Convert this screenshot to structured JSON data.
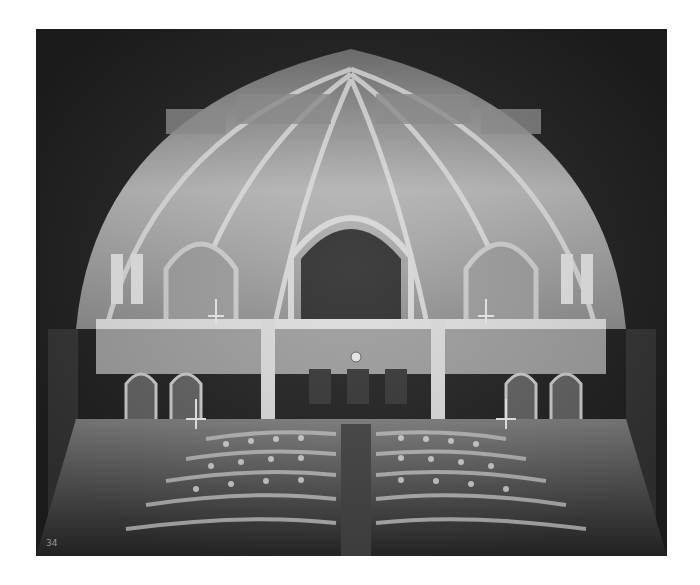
{
  "image": {
    "subject": "Interior of an ornate Victorian Gothic legislative chamber with vaulted ceiling, arches, balconies and curved rows of desks",
    "style": "black-and-white photograph",
    "corner_mark": "34"
  }
}
